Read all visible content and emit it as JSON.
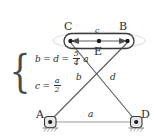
{
  "figure": {
    "width": 154,
    "height": 140,
    "background": "#ffffff",
    "line_color": "#555555",
    "text_color": "#2b2b2b",
    "highlight_color": "#d9d9d9"
  },
  "nodes": [
    {
      "id": "C",
      "label": "C",
      "x": 70,
      "y": 41,
      "label_x": 64,
      "label_y": 22
    },
    {
      "id": "B",
      "label": "B",
      "x": 128,
      "y": 41,
      "label_x": 119,
      "label_y": 22
    },
    {
      "id": "E",
      "label": "E",
      "x": 99,
      "y": 41,
      "label_x": 94,
      "label_y": 47
    },
    {
      "id": "A",
      "label": "A",
      "x": 50,
      "y": 122,
      "label_x": 36,
      "label_y": 110
    },
    {
      "id": "D",
      "label": "D",
      "x": 136,
      "y": 122,
      "label_x": 141,
      "label_y": 110
    }
  ],
  "members": [
    {
      "id": "a",
      "label": "a",
      "from": "A",
      "to": "D",
      "label_x": 88,
      "label_y": 110
    },
    {
      "id": "b",
      "label": "b",
      "from": "A",
      "to": "B",
      "label_x": 76,
      "label_y": 78
    },
    {
      "id": "d",
      "label": "d",
      "from": "D",
      "to": "C",
      "label_x": 110,
      "label_y": 78
    },
    {
      "id": "c",
      "label": "c",
      "from": "C",
      "to": "B",
      "label_x": 96,
      "label_y": 31
    }
  ],
  "supports": [
    {
      "at": "A",
      "type": "pin-support",
      "hatched": true
    },
    {
      "at": "D",
      "type": "pin-support",
      "hatched": true
    }
  ],
  "dimension_arrow": {
    "name": "c-span-arrow",
    "label": "c",
    "double_headed": true,
    "from_x": 72,
    "to_x": 126,
    "y": 41
  },
  "equations": {
    "brace": "{",
    "rows": [
      {
        "id": "eq-bd",
        "lhs": "b",
        "eq1": "=",
        "mid": "d",
        "eq2": "=",
        "frac_num": "5",
        "frac_den": "4",
        "suffix": "a",
        "plain": "b = d = 5/4 a"
      },
      {
        "id": "eq-c",
        "lhs": "c",
        "eq1": "=",
        "mid": "",
        "eq2": "",
        "frac_num": "a",
        "frac_den": "2",
        "suffix": "",
        "plain": "c = a/2"
      }
    ]
  }
}
